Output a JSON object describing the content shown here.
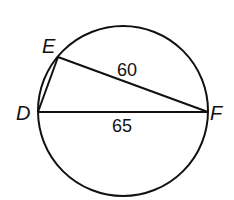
{
  "diagram": {
    "type": "circle with inscribed triangle",
    "points": {
      "D": {
        "label": "D"
      },
      "E": {
        "label": "E"
      },
      "F": {
        "label": "F"
      }
    },
    "segments": [
      {
        "from": "E",
        "to": "F",
        "length_label": "60"
      },
      {
        "from": "D",
        "to": "F",
        "length_label": "65"
      },
      {
        "from": "D",
        "to": "E",
        "length_label": ""
      }
    ],
    "colors": {
      "stroke": "#111111",
      "background": "#ffffff"
    }
  }
}
